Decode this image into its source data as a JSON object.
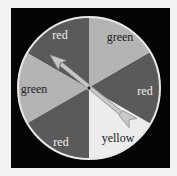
{
  "spinner": {
    "center": [
      89,
      88
    ],
    "radius": 71,
    "colors": {
      "frame": "#050505",
      "rim": "#e8e8e8",
      "red": "#5a5a5a",
      "green": "#b4b4b4",
      "yellow": "#ececec",
      "arrow_fill": "#c8c8c8",
      "arrow_stroke": "#8a8a8a"
    },
    "sectors": [
      {
        "label": "green",
        "start_deg": -90,
        "end_deg": -30,
        "shade": "green",
        "label_pos": [
          120,
          37
        ],
        "text_color": "#222222"
      },
      {
        "label": "red",
        "start_deg": -30,
        "end_deg": 30,
        "shade": "red",
        "label_pos": [
          145,
          91
        ],
        "text_color": "#f0f0f0"
      },
      {
        "label": "yellow",
        "start_deg": 30,
        "end_deg": 90,
        "shade": "yellow",
        "label_pos": [
          118,
          138
        ],
        "text_color": "#222222"
      },
      {
        "label": "red",
        "start_deg": 90,
        "end_deg": 150,
        "shade": "red",
        "label_pos": [
          61,
          142
        ],
        "text_color": "#f0f0f0"
      },
      {
        "label": "green",
        "start_deg": 150,
        "end_deg": 210,
        "shade": "green",
        "label_pos": [
          34,
          89
        ],
        "text_color": "#222222"
      },
      {
        "label": "red",
        "start_deg": 210,
        "end_deg": 270,
        "shade": "red",
        "label_pos": [
          60,
          35
        ],
        "text_color": "#f0f0f0"
      }
    ],
    "arrow": {
      "tip": [
        50,
        55
      ],
      "tail": [
        133,
        123
      ],
      "points_to": "red"
    }
  }
}
